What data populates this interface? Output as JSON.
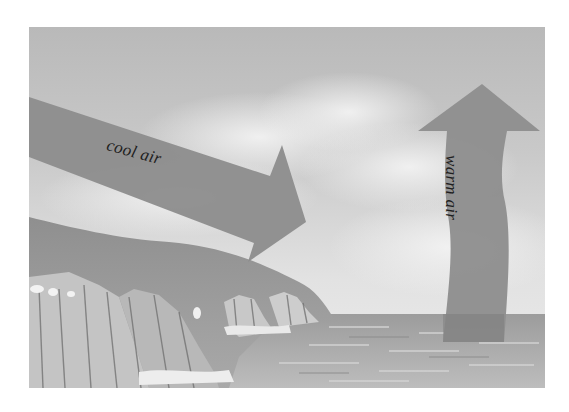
{
  "figure": {
    "labels": {
      "cool_air": "cool air",
      "warm_air": "warm air"
    },
    "arrows": [
      {
        "name": "cool-air-arrow",
        "direction": "down-right, from sea-side sky toward land",
        "label": "cool air"
      },
      {
        "name": "warm-air-arrow",
        "direction": "upward, rising from sea surface",
        "label": "warm air"
      }
    ],
    "scene": [
      "sky with clouds",
      "chalk cliffs on left",
      "sea surface on right"
    ],
    "colors": {
      "background": "#ffffff",
      "sky_top": "#bcbcbc",
      "sky_bottom": "#eaeaea",
      "arrow": "#8e8e8e",
      "cliff": "#a6a6a6",
      "sea": "#a9a9a9",
      "text": "#1e1e1e"
    }
  }
}
